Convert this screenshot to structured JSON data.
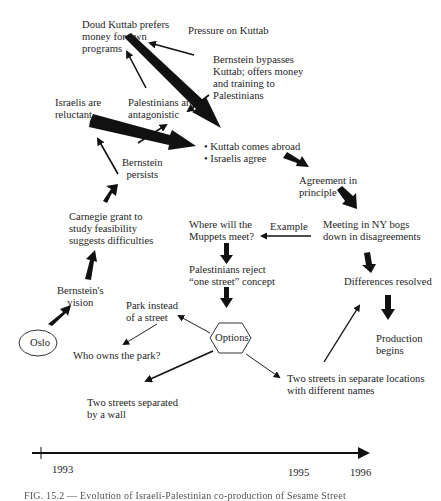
{
  "diagram": {
    "nodes": {
      "doud_kuttab": "Doud Kuttab prefers\nmoney for own\nprograms",
      "pressure": "Pressure on Kuttab",
      "bernstein_bypasses": "Bernstein bypasses\nKuttab; offers money\nand training to\nPalestinians",
      "israelis_reluctant": "Israelis are\nreluctant",
      "palestinians_antagonistic": "Palestinians are\nantagonistic",
      "bernstein_persists": "Bernstein\npersists",
      "kuttab_abroad": "• Kuttab comes abroad\n• Israelis agree",
      "agreement": "Agreement in\nprinciple",
      "carnegie": "Carnegie grant to\nstudy feasibility\nsuggests difficulties",
      "where_muppets": "Where will the\nMuppets meet?",
      "example": "Example",
      "meeting_ny": "Meeting in NY bogs\ndown in disagreements",
      "bernstein_vision": "Bernstein's\nvision",
      "palestinians_reject": "Palestinians reject\n“one street” concept",
      "differences_resolved": "Differences resolved",
      "park_instead": "Park instead\nof a street",
      "oslo": "Oslo",
      "options": "Options",
      "production": "Production\nbegins",
      "who_owns_park": "Who owns the park?",
      "two_streets_separate": "Two streets in separate locations\nwith different names",
      "two_streets_wall": "Two streets separated\nby a wall"
    },
    "timeline": {
      "years": [
        {
          "label": "1993",
          "x": 52,
          "y": 464
        },
        {
          "label": "1995",
          "x": 288,
          "y": 467
        },
        {
          "label": "1996",
          "x": 350,
          "y": 467
        }
      ]
    },
    "caption": "FIG. 15.2 — Evolution of Israeli-Palestinian co-production of Sesame Street"
  }
}
